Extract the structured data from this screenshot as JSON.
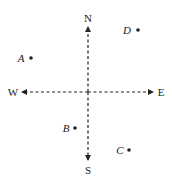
{
  "diagram": {
    "title": "",
    "compass": {
      "center": [
        88,
        92
      ],
      "directions": [
        {
          "id": "north",
          "label": "N",
          "tip": [
            88,
            27
          ],
          "label_pos": [
            88,
            22
          ]
        },
        {
          "id": "south",
          "label": "S",
          "tip": [
            88,
            160
          ],
          "label_pos": [
            88,
            174
          ]
        },
        {
          "id": "west",
          "label": "W",
          "tip": [
            22,
            92
          ],
          "label_pos": [
            13,
            96
          ]
        },
        {
          "id": "east",
          "label": "E",
          "tip": [
            153,
            92
          ],
          "label_pos": [
            161,
            96
          ]
        }
      ],
      "line_style": "dashed",
      "color": "#222222"
    },
    "points": [
      {
        "id": "A",
        "label": "A",
        "dot": [
          31,
          58
        ],
        "label_pos": [
          21,
          62
        ]
      },
      {
        "id": "B",
        "label": "B",
        "dot": [
          75,
          128
        ],
        "label_pos": [
          66,
          132
        ]
      },
      {
        "id": "C",
        "label": "C",
        "dot": [
          129,
          150
        ],
        "label_pos": [
          120,
          154
        ]
      },
      {
        "id": "D",
        "label": "D",
        "dot": [
          138,
          30
        ],
        "label_pos": [
          127,
          34
        ]
      }
    ]
  }
}
